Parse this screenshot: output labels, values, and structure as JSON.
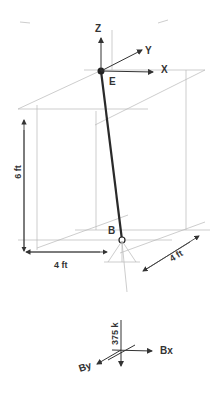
{
  "diagram": {
    "type": "3D statics free-body diagram",
    "axes": {
      "z_label": "Z",
      "y_label": "Y",
      "x_label": "X"
    },
    "points": {
      "top_label": "E",
      "bottom_label": "B"
    },
    "dimensions": {
      "height": "6 ft",
      "width_x": "4 ft",
      "depth_y": "4 ft"
    },
    "reactions": {
      "vertical_load": "375 k",
      "bx_label": "Bx",
      "by_label": "By"
    },
    "colors": {
      "member": "#2a2a2a",
      "guide_lines": "#b8b8b8",
      "text": "#333333"
    }
  }
}
